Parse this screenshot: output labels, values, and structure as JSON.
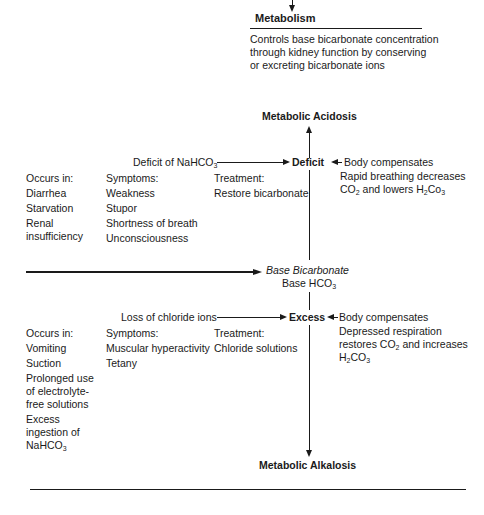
{
  "header": {
    "title": "Metabolism",
    "description_lines": [
      "Controls base bicarbonate concentration",
      "through kidney function by conserving",
      "or excreting bicarbonate ions"
    ]
  },
  "center": {
    "label_italic": "Base Bicarbonate",
    "label_plain": "Base HCO",
    "label_plain_sub": "3"
  },
  "acidosis": {
    "title": "Metabolic Acidosis",
    "node": "Deficit",
    "cause": "Deficit of NaHCO",
    "cause_sub": "3",
    "compensation_title": "Body compensates",
    "compensation_lines": [
      "Rapid breathing decreases",
      "CO",
      "2",
      " and lowers H",
      "2",
      "Co",
      "3"
    ],
    "occurs_in": {
      "header": "Occurs in:",
      "items": [
        "Diarrhea",
        "Starvation",
        "Renal",
        "insufficiency"
      ]
    },
    "symptoms": {
      "header": "Symptoms:",
      "items": [
        "Weakness",
        "Stupor",
        "Shortness of breath",
        "Unconsciousness"
      ]
    },
    "treatment": {
      "header": "Treatment:",
      "items": [
        "Restore bicarbonate"
      ]
    }
  },
  "alkalosis": {
    "title": "Metabolic Alkalosis",
    "node": "Excess",
    "cause": "Loss of chloride ions",
    "compensation_title": "Body compensates",
    "compensation_lines": [
      "Depressed respiration",
      "restores CO",
      "2",
      " and increases",
      "H",
      "2",
      "CO",
      "3"
    ],
    "occurs_in": {
      "header": "Occurs in:",
      "items": [
        "Vomiting",
        "Suction",
        "Prolonged use",
        "of electrolyte-",
        "free solutions",
        "Excess",
        "ingestion of",
        "NaHCO",
        "3"
      ]
    },
    "symptoms": {
      "header": "Symptoms:",
      "items": [
        "Muscular hyperactivity",
        "Tetany"
      ]
    },
    "treatment": {
      "header": "Treatment:",
      "items": [
        "Chloride solutions"
      ]
    }
  }
}
